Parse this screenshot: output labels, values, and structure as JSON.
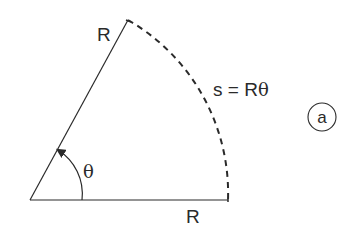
{
  "diagram": {
    "labels": {
      "radius_top": "R",
      "radius_bottom": "R",
      "angle": "θ",
      "arc_formula_prefix": "s = R",
      "arc_formula_theta": "θ",
      "panel_tag": "a"
    },
    "colors": {
      "stroke": "#2a2a2a",
      "background": "#ffffff"
    }
  }
}
